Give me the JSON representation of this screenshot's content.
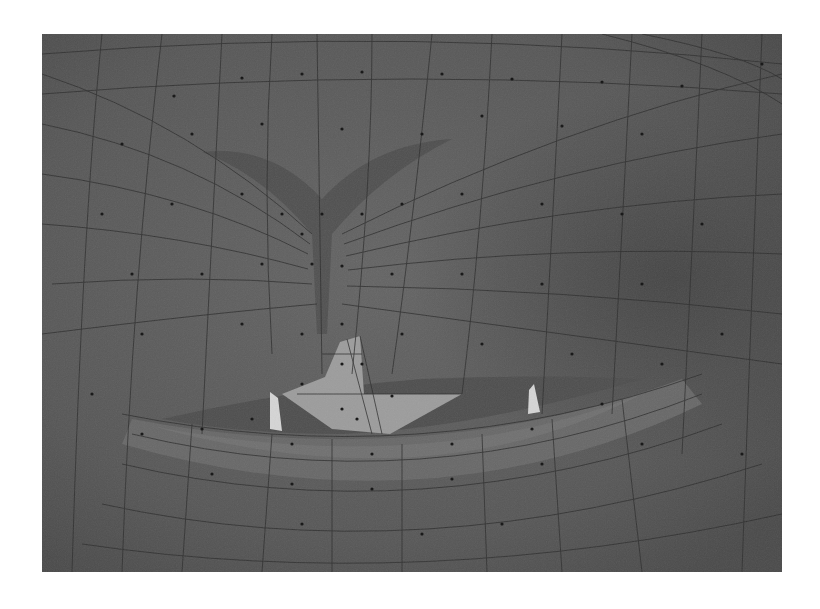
{
  "figure": {
    "colors": {
      "page_background": "#ffffff",
      "skin_base": "#5c5c5c",
      "skin_dark": "#444444",
      "skin_light": "#6a6a6a",
      "lip": "#6e6e6e",
      "teeth_plane": "#9a9a9a",
      "teeth_highlight": "#d8d8d8",
      "edge": "#2a2a2a",
      "vertex": "#111111"
    },
    "bounds": {
      "x": 42,
      "y": 34,
      "width": 740,
      "height": 538
    }
  }
}
